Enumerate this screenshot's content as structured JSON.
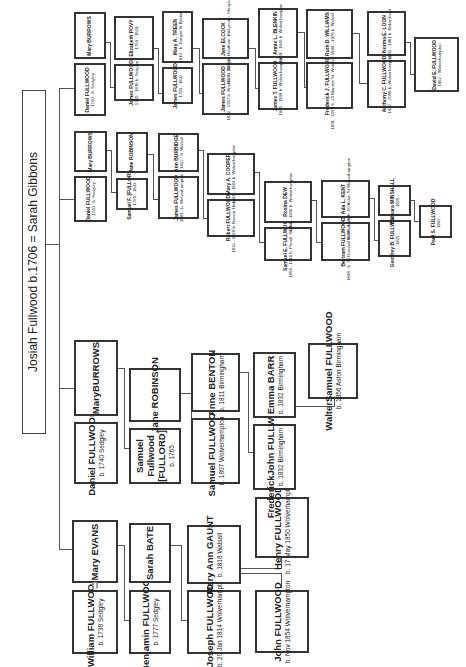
{
  "title": {
    "text": "Josiah Fullwood b.1706  =  Sarah Gibbons"
  },
  "branch1": {
    "gen1": {
      "name": "William FULLWOOD",
      "detail": "b. 1738 Sedgley",
      "spouse": "Mary EVANS",
      "spouse_detail": ""
    },
    "gen2": {
      "name": "Benjamin FULLWOOD",
      "detail": "b. 1777 Sedgley",
      "spouse": "Sarah BATE",
      "spouse_detail": ""
    },
    "gen3": {
      "name": "Joseph FULLWOOD",
      "detail": "b. 20 Jan 1814 Wolverhampton",
      "spouse": "Mary Ann GAUNT",
      "spouse_detail": "b. 1818 Walsall"
    },
    "gen4a": {
      "name": "John FULLWOOD",
      "detail": "b. Nov 1854 Wolverhampton"
    },
    "gen4b": {
      "name": "Henry FULLWOOD",
      "detail": "b. 17 May 1850 Wolverhampton"
    }
  },
  "branch2": {
    "gen1": {
      "name": "Daniel FULLWOOD",
      "detail": "b. 1740 Sedgley",
      "spouse": "MaryBURROWS",
      "spouse_detail": ""
    },
    "gen2": {
      "name": "Samuel Fullwood [FULLORD]",
      "detail": "b. 1765",
      "spouse": "Jane ROBINSON",
      "spouse_detail": ""
    },
    "gen3": {
      "name": "Samuel FULLWOOD",
      "detail": "b. 1807 Wolverhampton",
      "spouse": "Anne BENTON",
      "spouse_detail": "b. 1811 Birmingham"
    },
    "gen4": {
      "name": "FrederickJohn FULLWOOD",
      "detail": "b. 1832 Birmingham",
      "spouse": "Emma BARR",
      "spouse_detail": "b. 1832 Birmingham"
    },
    "gen5": {
      "name": "WalterSamuel FULLWOOD",
      "detail": "b. 1856 Aston Birmingham"
    }
  },
  "branch3": {
    "gen1": {
      "name": "Daniel FULLWOOD",
      "detail": "1740 - b. Sedgley",
      "spouse": "Mary BURROWS",
      "spouse_detail": ""
    },
    "gen2": {
      "name": "Samuel F. [FULLORD]",
      "detail": "1765 - 1833",
      "spouse": "Jane ROBINSON",
      "spouse_detail": ""
    },
    "gen3": {
      "name": "James FULLWOOD",
      "detail": "1801 - b. Wolverhampton",
      "spouse": "Ann BURBIDGE",
      "spouse_detail": "1812 - b. Walsall"
    },
    "gen4": {
      "name": "Robert FULLWOOD",
      "detail": "1834 - 1928 b. Bescot Heath, Worcs",
      "spouse": "Mary A. COOPER",
      "spouse_detail": "1836 - 1863 b. Wolverhampton"
    },
    "gen5": {
      "name": "Samuel E. FULLWOOD",
      "detail": "1858 - 1918 b. Penall, Staffordshire",
      "spouse": "Rosina DEW",
      "spouse_detail": "1859 - 1936 b. Wolverhampton"
    },
    "gen6": {
      "name": "Bertram FULLWOOD",
      "detail": "1898 - b. 58 Dunstall Rd Wolverhampton",
      "spouse": "Ada L. KENT",
      "spouse_detail": "1898 - 1927 b. 50 Alden St Wolverhampton"
    },
    "gen7": {
      "name": "Geoffrey B. FULLWOOD",
      "detail": "1925 -",
      "spouse": "Barbara MINSHALL",
      "spouse_detail": "1925 -"
    },
    "gen8": {
      "name": "Paul S. FULLWOOD",
      "detail": "1962 -"
    }
  },
  "branch4": {
    "gen1": {
      "name": "Daniel FULLWOOD",
      "detail": "1740 - b. Sedgley",
      "spouse": "Mary BURROWS",
      "spouse_detail": ""
    },
    "gen2": {
      "name": "James FULLWOOD",
      "detail": "1760 - 1818 b. Sedgley",
      "spouse": "Elizabeth POVY",
      "spouse_detail": "1763 - 1829"
    },
    "gen3": {
      "name": "James FULLWOOD",
      "detail": "1793 - 1832",
      "spouse": "Mary A. TREEN",
      "spouse_detail": "1810 - b. Temple St Bilston"
    },
    "gen4": {
      "name": "James FULLWOOD",
      "detail": "1832 - 1917 b. Brooke St. Bilston",
      "spouse": "Jane ELCOCK",
      "spouse_detail": "1829 - 1906 b. Heathton, Bridgnorth, Shropshire"
    },
    "gen5": {
      "name": "James T. FULLWOOD",
      "detail": "1865 - 1939 b. Wolverhampton",
      "spouse": "Annie L. BLENKIN",
      "spouse_detail": "1869 - 1940 b. Wolverhampton"
    },
    "gen6": {
      "name": "Frederick J. FULLWOOD",
      "detail": "1891 - 1975 b. 25 Mander St. Wolverhampton",
      "spouse": "Ruth D. WILLIAMS",
      "spouse_detail": "1890 - 1978 b. Walsall"
    },
    "gen7": {
      "name": "Anthony C. FULLWOOD",
      "detail": "1927 - 2008 b. Wolverhampton",
      "spouse": "Norma E. LOON",
      "spouse_detail": "1931 - 1981 b. Birkenhead"
    },
    "gen8": {
      "name": "David E. FULLWOOD",
      "detail": "1962 - Wolverhampton"
    }
  }
}
